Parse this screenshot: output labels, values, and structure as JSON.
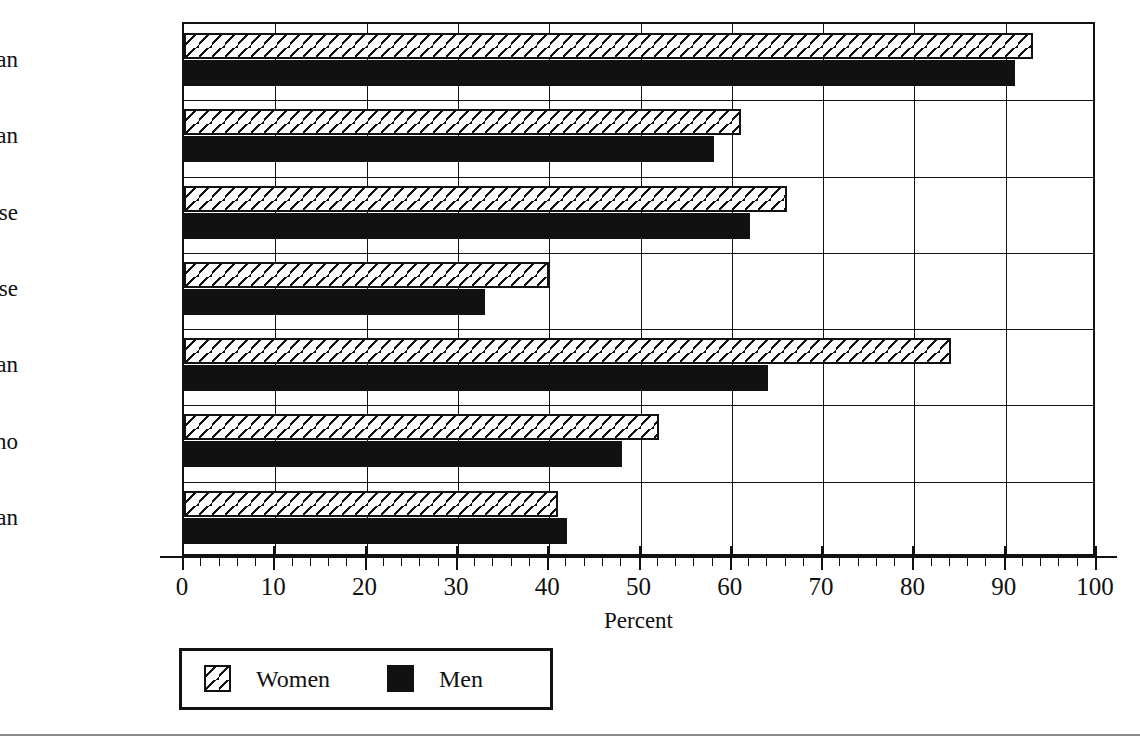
{
  "chart_data": {
    "type": "bar",
    "orientation": "horizontal",
    "title": "",
    "xlabel": "Percent",
    "ylabel": "",
    "xlim": [
      0,
      100
    ],
    "xticks": [
      0,
      10,
      20,
      30,
      40,
      50,
      60,
      70,
      80,
      90,
      100
    ],
    "xtick_labels": [
      "0",
      "10",
      "20",
      "30",
      "40",
      "50",
      "60",
      "70",
      "80",
      "90",
      "100"
    ],
    "minor_tick_step": 2,
    "grid": "vertical-major",
    "legend_position": "below-axes-left",
    "categories": [
      "Hawaiian",
      "Part-Hawaiian",
      "Chinese",
      "Japanese",
      "Korean",
      "Filipino",
      "Samoan"
    ],
    "series": [
      {
        "name": "Women",
        "fill": "diagonal-hatch",
        "color": "#ffffff",
        "values": [
          93,
          61,
          66,
          40,
          84,
          52,
          41
        ]
      },
      {
        "name": "Men",
        "fill": "solid",
        "color": "#111111",
        "values": [
          91,
          58,
          62,
          33,
          64,
          48,
          42
        ]
      }
    ]
  },
  "legend": {
    "entries": [
      {
        "label": "Women"
      },
      {
        "label": "Men"
      }
    ]
  },
  "axis": {
    "x_title": "Percent"
  }
}
